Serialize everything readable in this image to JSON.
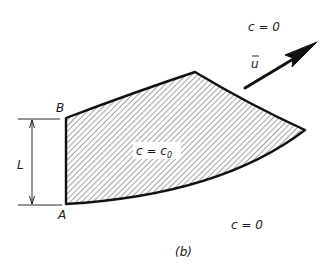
{
  "figure": {
    "caption": "(b)",
    "region_label": "c = c",
    "region_label_subscript": "0",
    "outer_label_top": "c = 0",
    "outer_label_bottom": "c = 0",
    "velocity_label": "u",
    "point_a": "A",
    "point_b": "B",
    "length_label": "L"
  },
  "colors": {
    "stroke": "#111111",
    "hatch": "#333333",
    "background": "#ffffff"
  }
}
